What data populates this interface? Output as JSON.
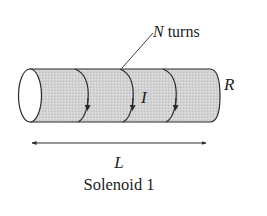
{
  "diagram": {
    "title": "Solenoid 1",
    "labels": {
      "turns_var": "N",
      "turns_text": " turns",
      "radius": "R",
      "current": "I",
      "length": "L",
      "caption": "Solenoid 1"
    },
    "colors": {
      "body_fill": "#d4d4d4",
      "stroke": "#2a2a2a",
      "end_cap": "#ffffff",
      "text": "#222222"
    },
    "turns_count_drawn": 3
  }
}
